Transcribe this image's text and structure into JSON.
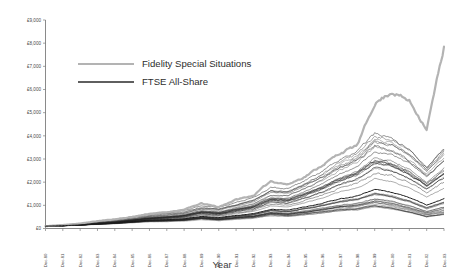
{
  "chart_data": {
    "type": "line",
    "title": "",
    "xlabel": "Year",
    "ylabel": "",
    "ylim": [
      0,
      9000
    ],
    "ytick_labels": [
      "£0",
      "£1,000",
      "£2,000",
      "£3,000",
      "£4,000",
      "£5,000",
      "£6,000",
      "£7,000",
      "£8,000",
      "£9,000"
    ],
    "ytick_values": [
      0,
      1000,
      2000,
      3000,
      4000,
      5000,
      6000,
      7000,
      8000,
      9000
    ],
    "grid": false,
    "legend_position": "upper-left-inside",
    "x": [
      "Dec-80",
      "Dec-81",
      "Dec-82",
      "Dec-83",
      "Dec-84",
      "Dec-85",
      "Dec-86",
      "Dec-87",
      "Dec-88",
      "Dec-89",
      "Dec-90",
      "Dec-91",
      "Dec-92",
      "Dec-93",
      "Dec-94",
      "Dec-95",
      "Dec-96",
      "Dec-97",
      "Dec-98",
      "Dec-99",
      "Dec-00",
      "Dec-01",
      "Dec-02",
      "Dec-03"
    ],
    "series": [
      {
        "name": "Fidelity Special Situations",
        "color": "#b3b3b3",
        "width": 2.2,
        "values": [
          100,
          150,
          215,
          320,
          400,
          500,
          640,
          700,
          820,
          1080,
          930,
          1250,
          1420,
          2050,
          1900,
          2250,
          2750,
          3250,
          3600,
          5400,
          5900,
          5500,
          4300,
          7850
        ]
      },
      {
        "name": "FTSE All-Share",
        "color": "#1a1a1a",
        "width": 1.0,
        "values": [
          100,
          122,
          155,
          200,
          240,
          300,
          360,
          380,
          420,
          520,
          470,
          560,
          640,
          830,
          790,
          930,
          1090,
          1280,
          1400,
          1680,
          1560,
          1330,
          1020,
          1290
        ]
      }
    ],
    "peer_series_note": "Dense bundle of peer fund lines shown in dark grey/black behind the two named series",
    "peer_count": 34
  },
  "legend": {
    "items": [
      {
        "label": "Fidelity Special Situations",
        "color": "#b3b3b3"
      },
      {
        "label": "FTSE All-Share",
        "color": "#2a2a2a"
      }
    ]
  },
  "axis": {
    "x_title": "Year"
  }
}
